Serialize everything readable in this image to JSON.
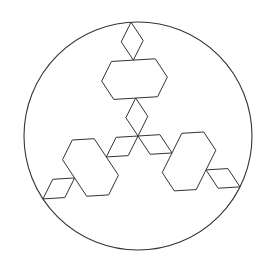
{
  "figure": {
    "background": "#ffffff",
    "stroke_color": "#333333",
    "circle": {
      "cx": 138,
      "cy": 136,
      "r": 114
    },
    "snowflake": {
      "cx": 138,
      "cy": 136,
      "r": 114,
      "iterations": 2,
      "rotation_deg": -93.5
    }
  }
}
